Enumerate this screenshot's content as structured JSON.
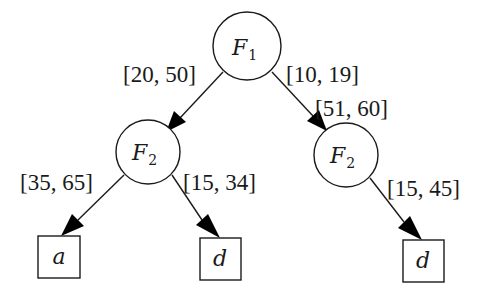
{
  "diagram": {
    "type": "decision-tree",
    "nodes": [
      {
        "id": "root",
        "shape": "circle",
        "label": "F",
        "subscript": "1"
      },
      {
        "id": "left",
        "shape": "circle",
        "label": "F",
        "subscript": "2"
      },
      {
        "id": "right",
        "shape": "circle",
        "label": "F",
        "subscript": "2"
      },
      {
        "id": "leaf_a",
        "shape": "box",
        "label": "a"
      },
      {
        "id": "leaf_d1",
        "shape": "box",
        "label": "d"
      },
      {
        "id": "leaf_d2",
        "shape": "box",
        "label": "d"
      }
    ],
    "edges": [
      {
        "from": "root",
        "to": "left",
        "label": "[20, 50]"
      },
      {
        "from": "root",
        "to": "right",
        "label": "[10, 19]"
      },
      {
        "from": "root",
        "to": "right",
        "label": "[51, 60]"
      },
      {
        "from": "left",
        "to": "leaf_a",
        "label": "[35, 65]"
      },
      {
        "from": "left",
        "to": "leaf_d1",
        "label": "[15, 34]"
      },
      {
        "from": "right",
        "to": "leaf_d2",
        "label": "[15, 45]"
      }
    ]
  }
}
